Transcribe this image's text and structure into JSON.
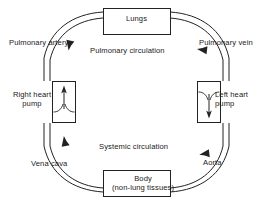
{
  "diagram": {
    "boxes": {
      "lungs": {
        "label": "Lungs"
      },
      "body": {
        "label": "Body",
        "sublabel": "(non-lung tissues)"
      },
      "right_heart_pump": {
        "label_line1": "Right heart",
        "label_line2": "pump"
      },
      "left_heart_pump": {
        "label_line1": "Left heart",
        "label_line2": "pump"
      }
    },
    "vessel_labels": {
      "pulmonary_artery": "Pulmonary artery",
      "pulmonary_vein": "Pulmonary vein",
      "vena_cava": "Vena cava",
      "aorta": "Aorta"
    },
    "circuit_labels": {
      "pulmonary": "Pulmonary circulation",
      "systemic": "Systemic circulation"
    },
    "icons": {
      "flow_arrow_pulmonary_artery": "arrow-up-icon",
      "flow_arrow_pulmonary_vein": "arrow-down-icon",
      "flow_arrow_vena_cava": "arrow-down-icon",
      "flow_arrow_aorta": "arrow-up-icon",
      "right_pump_direction": "arrow-up-icon",
      "left_pump_direction": "arrow-down-icon"
    },
    "colors": {
      "stroke": "#222222",
      "text": "#1a1a1a",
      "background": "#ffffff"
    }
  }
}
